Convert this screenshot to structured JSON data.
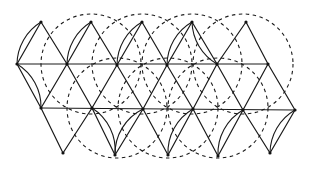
{
  "diagram": {
    "title": "",
    "colors": {
      "ink": "#1a1a1a",
      "background": "#ffffff"
    },
    "vertices": [
      {
        "id": "a0",
        "x": 41,
        "y": 22
      },
      {
        "id": "a1",
        "x": 91,
        "y": 22
      },
      {
        "id": "a2",
        "x": 142,
        "y": 22
      },
      {
        "id": "a3",
        "x": 192,
        "y": 22
      },
      {
        "id": "a4",
        "x": 246,
        "y": 22
      },
      {
        "id": "b0",
        "x": 17,
        "y": 64
      },
      {
        "id": "b1",
        "x": 67,
        "y": 64
      },
      {
        "id": "b2",
        "x": 117,
        "y": 65
      },
      {
        "id": "b3",
        "x": 167,
        "y": 65
      },
      {
        "id": "b4",
        "x": 217,
        "y": 64
      },
      {
        "id": "b5",
        "x": 268,
        "y": 64
      },
      {
        "id": "c0",
        "x": 41,
        "y": 108
      },
      {
        "id": "c1",
        "x": 92,
        "y": 108
      },
      {
        "id": "c2",
        "x": 143,
        "y": 109
      },
      {
        "id": "c3",
        "x": 193,
        "y": 109
      },
      {
        "id": "c4",
        "x": 243,
        "y": 110
      },
      {
        "id": "c5",
        "x": 295,
        "y": 110
      },
      {
        "id": "d0",
        "x": 63,
        "y": 153
      },
      {
        "id": "d1",
        "x": 115,
        "y": 155
      },
      {
        "id": "d2",
        "x": 168,
        "y": 155
      },
      {
        "id": "d3",
        "x": 218,
        "y": 156
      },
      {
        "id": "d4",
        "x": 270,
        "y": 153
      }
    ],
    "edges": [
      [
        "b0",
        "b5"
      ],
      [
        "c0",
        "c5"
      ],
      [
        "a0",
        "b0"
      ],
      [
        "a0",
        "b1"
      ],
      [
        "a1",
        "b1"
      ],
      [
        "a1",
        "b2"
      ],
      [
        "a2",
        "b2"
      ],
      [
        "a2",
        "b3"
      ],
      [
        "a3",
        "b3"
      ],
      [
        "a3",
        "b4"
      ],
      [
        "a4",
        "b4"
      ],
      [
        "a4",
        "b5"
      ],
      [
        "b0",
        "c0"
      ],
      [
        "b1",
        "c0"
      ],
      [
        "b1",
        "c1"
      ],
      [
        "b2",
        "c1"
      ],
      [
        "b2",
        "c2"
      ],
      [
        "b3",
        "c2"
      ],
      [
        "b3",
        "c3"
      ],
      [
        "b4",
        "c3"
      ],
      [
        "b4",
        "c4"
      ],
      [
        "b5",
        "c4"
      ],
      [
        "b5",
        "c5"
      ],
      [
        "c0",
        "d0"
      ],
      [
        "c1",
        "d0"
      ],
      [
        "c1",
        "d1"
      ],
      [
        "c2",
        "d1"
      ],
      [
        "c2",
        "d2"
      ],
      [
        "c3",
        "d2"
      ],
      [
        "c3",
        "d3"
      ],
      [
        "c4",
        "d3"
      ],
      [
        "c4",
        "d4"
      ],
      [
        "c5",
        "d4"
      ]
    ],
    "solid_arcs": [
      {
        "from": "b0",
        "to": "a0",
        "bulge": "left"
      },
      {
        "from": "b0",
        "to": "c0",
        "bulge": "left"
      },
      {
        "from": "b1",
        "to": "a1",
        "bulge": "left"
      },
      {
        "from": "b2",
        "to": "a2",
        "bulge": "left"
      },
      {
        "from": "b3",
        "to": "a3",
        "bulge": "left"
      },
      {
        "from": "a3",
        "to": "b4",
        "bulge": "right"
      },
      {
        "from": "c1",
        "to": "d1",
        "bulge": "left"
      },
      {
        "from": "c2",
        "to": "d1",
        "bulge": "right"
      },
      {
        "from": "c3",
        "to": "d2",
        "bulge": "right"
      },
      {
        "from": "c4",
        "to": "d3",
        "bulge": "right"
      },
      {
        "from": "c5",
        "to": "d4",
        "bulge": "right"
      }
    ],
    "dashed_circles": [
      {
        "cx": 91,
        "cy": 64,
        "r": 50
      },
      {
        "cx": 142,
        "cy": 64,
        "r": 50
      },
      {
        "cx": 192,
        "cy": 64,
        "r": 50
      },
      {
        "cx": 243,
        "cy": 64,
        "r": 50
      },
      {
        "cx": 117,
        "cy": 108,
        "r": 50
      },
      {
        "cx": 168,
        "cy": 108,
        "r": 50
      },
      {
        "cx": 218,
        "cy": 108,
        "r": 50
      }
    ]
  }
}
